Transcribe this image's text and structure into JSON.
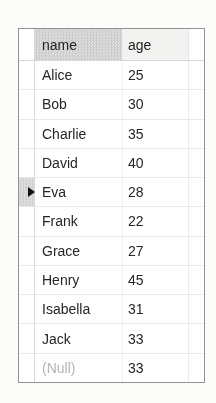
{
  "grid": {
    "columns": [
      {
        "key": "name",
        "label": "name"
      },
      {
        "key": "age",
        "label": "age"
      }
    ],
    "rows": [
      {
        "name": "Alice",
        "age": "25"
      },
      {
        "name": "Bob",
        "age": "30"
      },
      {
        "name": "Charlie",
        "age": "35"
      },
      {
        "name": "David",
        "age": "40"
      },
      {
        "name": "Eva",
        "age": "28"
      },
      {
        "name": "Frank",
        "age": "22"
      },
      {
        "name": "Grace",
        "age": "27"
      },
      {
        "name": "Henry",
        "age": "45"
      },
      {
        "name": "Isabella",
        "age": "31"
      },
      {
        "name": "Jack",
        "age": "33"
      },
      {
        "name": "(Null)",
        "age": "33",
        "name_is_null": true
      }
    ],
    "current_row_index": 4,
    "colors": {
      "border": "#929292",
      "gridline": "#e8e8e8",
      "header_bg": "#f2f2f1",
      "text": "#262626",
      "null_text": "#b5b5b5",
      "marker": "#111111"
    }
  }
}
